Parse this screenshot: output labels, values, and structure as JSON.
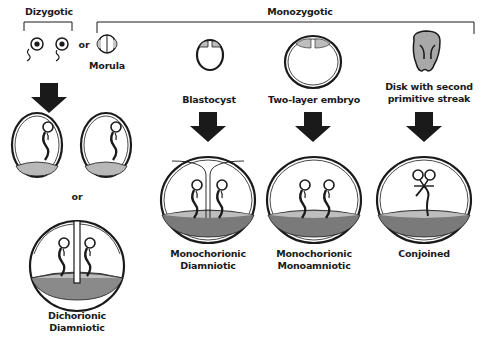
{
  "groups": {
    "dizygotic": "Dizygotic",
    "monozygotic": "Monozygotic"
  },
  "connector_or_top": "or",
  "connector_or_mid": "or",
  "stages": {
    "morula": "Morula",
    "blastocyst": "Blastocyst",
    "two_layer": "Two-layer embryo",
    "disk_line1": "Disk with second",
    "disk_line2": "primitive streak"
  },
  "outcomes": {
    "dichorionic_1": "Dichorionic",
    "dichorionic_2": "Diamniotic",
    "mono_di_1": "Monochorionic",
    "mono_di_2": "Diamniotic",
    "mono_mono_1": "Monochorionic",
    "mono_mono_2": "Monoamniotic",
    "conjoined": "Conjoined"
  },
  "colors": {
    "ink": "#1a1a1a",
    "placenta_light": "#b8b8b8",
    "placenta_dark": "#7a7a7a",
    "disk": "#a8a8a8"
  }
}
